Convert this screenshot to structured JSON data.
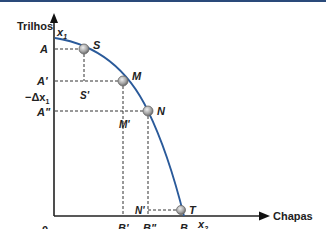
{
  "diagram": {
    "type": "production-possibilities-frontier",
    "y_axis": {
      "title": "Trilhos",
      "variable": "x",
      "variable_sub": "1"
    },
    "x_axis": {
      "title": "Chapas",
      "variable": "x",
      "variable_sub": "2"
    },
    "origin_label": "0",
    "points": [
      {
        "id": "S",
        "label": "S"
      },
      {
        "id": "M",
        "label": "M"
      },
      {
        "id": "N",
        "label": "N"
      },
      {
        "id": "T",
        "label": "T"
      }
    ],
    "y_labels": {
      "A": "A",
      "A1": "A'",
      "A2": "A\"",
      "delta": "−Δx",
      "delta_sub": "1"
    },
    "x_labels": {
      "B1": "B'",
      "B2": "B\"",
      "B": "B",
      "delta": "+Δ x",
      "delta_sub": "2"
    },
    "inner_labels": {
      "S1": "S'",
      "M1": "M'",
      "N1": "N'"
    },
    "colors": {
      "curve": "#2a5a9a",
      "axis": "#222222",
      "point_fill": "#b8b8b8",
      "point_stroke": "#666666",
      "top_bar": "#2a4a7a"
    }
  }
}
